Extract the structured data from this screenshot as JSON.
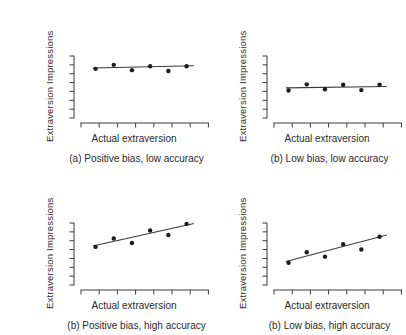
{
  "figure": {
    "background": "#ffffff",
    "ink": "#2a2a2a",
    "axis_color": "#3a3a3a",
    "fit_line_color": "#3a3a3a",
    "point_color": "#1c1c1c"
  },
  "chart_data": [
    {
      "type": "scatter",
      "position": "top-left",
      "caption": "(a) Positive bias, low accuracy",
      "xlabel": "Actual extraversion",
      "ylabel": "Extraversion Impressions",
      "x": [
        0.8,
        1.8,
        2.8,
        3.8,
        4.8,
        5.8
      ],
      "y": [
        5.55,
        6.0,
        5.4,
        5.85,
        5.3,
        5.85
      ],
      "fit_line": {
        "x": [
          0.65,
          6.2
        ],
        "y": [
          5.65,
          5.9
        ]
      },
      "xlim": [
        0,
        7
      ],
      "ylim": [
        0,
        7
      ],
      "x_ticks": [
        0,
        1,
        2,
        3,
        4,
        5,
        6,
        7
      ],
      "y_ticks": [
        0,
        1,
        2,
        3,
        4,
        5,
        6,
        7
      ],
      "tick_labels_shown": false,
      "grid": false,
      "legend": null
    },
    {
      "type": "scatter",
      "position": "top-right",
      "caption": "(b) Low bias, low accuracy",
      "xlabel": "Actual extraversion",
      "ylabel": "Extraversion Impressions",
      "x": [
        0.8,
        1.8,
        2.8,
        3.8,
        4.8,
        5.8
      ],
      "y": [
        3.1,
        3.8,
        3.25,
        3.75,
        3.15,
        3.75
      ],
      "fit_line": {
        "x": [
          0.65,
          6.2
        ],
        "y": [
          3.4,
          3.55
        ]
      },
      "xlim": [
        0,
        7
      ],
      "ylim": [
        0,
        7
      ],
      "x_ticks": [
        0,
        1,
        2,
        3,
        4,
        5,
        6,
        7
      ],
      "y_ticks": [
        0,
        1,
        2,
        3,
        4,
        5,
        6,
        7
      ],
      "tick_labels_shown": false,
      "grid": false,
      "legend": null
    },
    {
      "type": "scatter",
      "position": "bottom-left",
      "caption": "(b) Positive bias, high accuracy",
      "xlabel": "Actual extraversion",
      "ylabel": "Extraversion Impressions",
      "x": [
        0.8,
        1.8,
        2.8,
        3.8,
        4.8,
        5.8
      ],
      "y": [
        4.3,
        5.25,
        4.75,
        6.15,
        5.65,
        6.9
      ],
      "fit_line": {
        "x": [
          0.65,
          6.2
        ],
        "y": [
          4.4,
          6.95
        ]
      },
      "xlim": [
        0,
        7
      ],
      "ylim": [
        0,
        7
      ],
      "x_ticks": [
        0,
        1,
        2,
        3,
        4,
        5,
        6,
        7
      ],
      "y_ticks": [
        0,
        1,
        2,
        3,
        4,
        5,
        6,
        7
      ],
      "tick_labels_shown": false,
      "grid": false,
      "legend": null
    },
    {
      "type": "scatter",
      "position": "bottom-right",
      "caption": "(b) Low bias, high accuracy",
      "xlabel": "Actual extraversion",
      "ylabel": "Extraversion Impressions",
      "x": [
        0.8,
        1.8,
        2.8,
        3.8,
        4.8,
        5.8
      ],
      "y": [
        2.5,
        3.7,
        3.2,
        4.6,
        4.0,
        5.45
      ],
      "fit_line": {
        "x": [
          0.65,
          6.2
        ],
        "y": [
          2.65,
          5.65
        ]
      },
      "xlim": [
        0,
        7
      ],
      "ylim": [
        0,
        7
      ],
      "x_ticks": [
        0,
        1,
        2,
        3,
        4,
        5,
        6,
        7
      ],
      "y_ticks": [
        0,
        1,
        2,
        3,
        4,
        5,
        6,
        7
      ],
      "tick_labels_shown": false,
      "grid": false,
      "legend": null
    }
  ]
}
